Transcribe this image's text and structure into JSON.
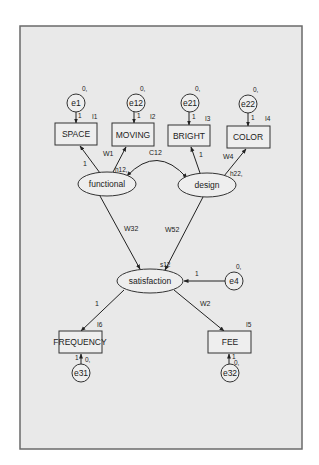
{
  "diagram": {
    "type": "structural-equation-model",
    "frame": {
      "background": "#e9e9e9",
      "border": "#6a6a6a"
    },
    "latent_variables": [
      {
        "id": "functional",
        "label": "functional",
        "variance_label": "h12,"
      },
      {
        "id": "design",
        "label": "design",
        "variance_label": "h22,"
      },
      {
        "id": "satisfaction",
        "label": "satisfaction",
        "variance_label": "s12"
      }
    ],
    "observed_variables": [
      {
        "id": "SPACE",
        "label": "SPACE",
        "intercept": "I1"
      },
      {
        "id": "MOVING",
        "label": "MOVING",
        "intercept": "I2"
      },
      {
        "id": "BRIGHT",
        "label": "BRIGHT",
        "intercept": "I3"
      },
      {
        "id": "COLOR",
        "label": "COLOR",
        "intercept": "I4"
      },
      {
        "id": "FREQUENCY",
        "label": "FREQUENCY",
        "intercept": "I6"
      },
      {
        "id": "FEE",
        "label": "FEE",
        "intercept": "I5"
      }
    ],
    "error_terms": [
      {
        "id": "e1",
        "label": "e1",
        "mean": "0,",
        "path_label": "1",
        "target": "SPACE"
      },
      {
        "id": "e12",
        "label": "e12",
        "mean": "0,",
        "path_label": "1",
        "target": "MOVING"
      },
      {
        "id": "e21",
        "label": "e21",
        "mean": "0,",
        "path_label": "1",
        "target": "BRIGHT"
      },
      {
        "id": "e22",
        "label": "e22",
        "mean": "0,",
        "path_label": "1",
        "target": "COLOR"
      },
      {
        "id": "e4",
        "label": "e4",
        "mean": "0,",
        "path_label": "1",
        "target": "satisfaction"
      },
      {
        "id": "e31",
        "label": "e31",
        "mean": "0,",
        "path_label": "1",
        "target": "FREQUENCY"
      },
      {
        "id": "e32",
        "label": "e32",
        "mean": "0,",
        "path_label": "1",
        "target": "FEE"
      }
    ],
    "paths": [
      {
        "from": "functional",
        "to": "SPACE",
        "label": "1"
      },
      {
        "from": "functional",
        "to": "MOVING",
        "label": "W1"
      },
      {
        "from": "design",
        "to": "BRIGHT",
        "label": "1"
      },
      {
        "from": "design",
        "to": "COLOR",
        "label": "W4"
      },
      {
        "from": "functional",
        "to": "satisfaction",
        "label": "W32"
      },
      {
        "from": "design",
        "to": "satisfaction",
        "label": "W52"
      },
      {
        "from": "satisfaction",
        "to": "FREQUENCY",
        "label": "1"
      },
      {
        "from": "satisfaction",
        "to": "FEE",
        "label": "W2"
      }
    ],
    "covariances": [
      {
        "between": [
          "functional",
          "design"
        ],
        "label": "C12"
      }
    ]
  }
}
